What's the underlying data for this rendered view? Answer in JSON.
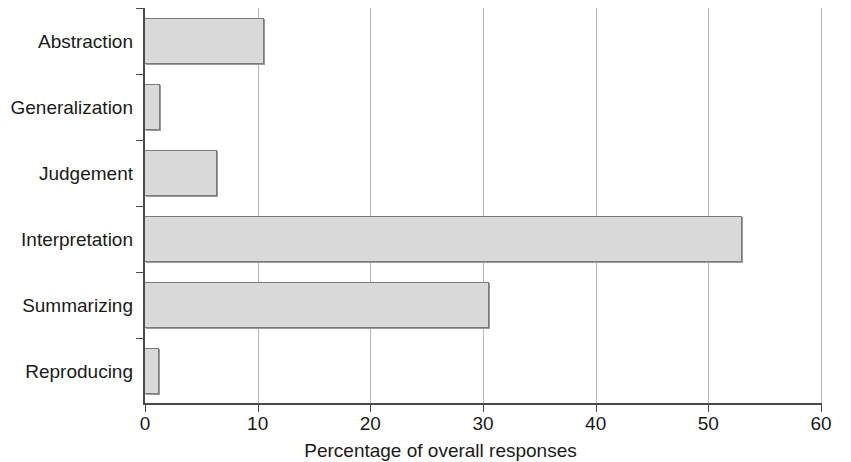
{
  "chart_data": {
    "type": "bar",
    "orientation": "horizontal",
    "title": "",
    "subtitle": "",
    "xlabel": "Percentage of overall responses",
    "ylabel": "",
    "xlim": [
      0,
      60
    ],
    "xticks": [
      0,
      10,
      20,
      30,
      40,
      50,
      60
    ],
    "xtick_labels": [
      "0",
      "10",
      "20",
      "30",
      "40",
      "50",
      "60"
    ],
    "grid": "vertical",
    "legend": null,
    "categories": [
      "Abstraction",
      "Generalization",
      "Judgement",
      "Interpretation",
      "Summarizing",
      "Reproducing"
    ],
    "values": [
      10.6,
      1.3,
      6.4,
      53.0,
      30.5,
      1.2
    ],
    "series": [
      {
        "name": "Percentage of overall responses",
        "values": [
          10.6,
          1.3,
          6.4,
          53.0,
          30.5,
          1.2
        ]
      }
    ],
    "colors": {
      "bar_fill": "#d9d9d9",
      "bar_border": "#7b7b7b",
      "axis": "#4a4a4a",
      "gridline": "#b9b9b9",
      "text": "#1a1a1a",
      "background": "#ffffff"
    }
  }
}
